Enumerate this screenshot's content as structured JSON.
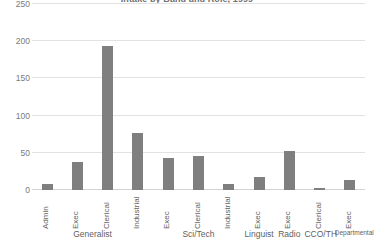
{
  "chart_data": {
    "type": "bar",
    "title": "Intake by Band and Role, 1999",
    "xlabel": "",
    "ylabel": "",
    "ylim": [
      0,
      250
    ],
    "yticks": [
      0,
      50,
      100,
      150,
      200,
      250
    ],
    "ytick_labels": [
      "0",
      "50",
      "100",
      "150",
      "200",
      "250"
    ],
    "grid": true,
    "legend": "none",
    "bar_color": "#7f7f7f",
    "categories": [
      "Admin",
      "Exec",
      "Clerical",
      "Industrial",
      "Exec",
      "Clerical",
      "Industrial",
      "Exec",
      "Exec",
      "Clerical",
      "Exec"
    ],
    "values": [
      8,
      38,
      193,
      76,
      43,
      46,
      8,
      17,
      52,
      1,
      13
    ],
    "groups": [
      {
        "label": "Generalist",
        "start": 0,
        "end": 3,
        "small": false
      },
      {
        "label": "Sci/Tech",
        "start": 4,
        "end": 6,
        "small": false
      },
      {
        "label": "Linguist",
        "start": 7,
        "end": 7,
        "small": false
      },
      {
        "label": "Radio",
        "start": 8,
        "end": 8,
        "small": false
      },
      {
        "label": "CCO/TH",
        "start": 9,
        "end": 9,
        "small": false
      },
      {
        "label": "Departmental",
        "start": 10,
        "end": 10,
        "small": true
      }
    ]
  }
}
